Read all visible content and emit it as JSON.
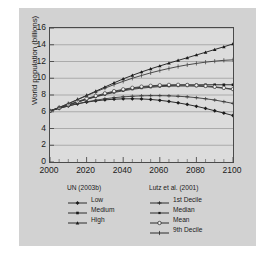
{
  "chart_data": {
    "type": "line",
    "title": "",
    "subtitle": "",
    "xlabel": "",
    "ylabel": "World population (billions)",
    "xlim": [
      2000,
      2100
    ],
    "ylim": [
      0,
      16
    ],
    "xticks": [
      "2000",
      "2020",
      "2040",
      "2060",
      "2080",
      "2100"
    ],
    "yticks": [
      "0",
      "2",
      "4",
      "6",
      "8",
      "10",
      "12",
      "14",
      "16"
    ],
    "xtick_step": 20,
    "ytick_step": 2,
    "minor_xtick_step": 5,
    "grid": "horizontal",
    "legend_position": "below",
    "x": [
      2000,
      2005,
      2010,
      2015,
      2020,
      2025,
      2030,
      2035,
      2040,
      2045,
      2050,
      2055,
      2060,
      2065,
      2070,
      2075,
      2080,
      2085,
      2090,
      2095,
      2100
    ],
    "legend_groups": [
      {
        "title": "UN (2003b)",
        "entries": [
          {
            "label": "Low",
            "marker": "filled-diamond"
          },
          {
            "label": "Medium",
            "marker": "filled-square"
          },
          {
            "label": "High",
            "marker": "filled-triangle"
          }
        ]
      },
      {
        "title": "Lutz et al. (2001)",
        "entries": [
          {
            "label": "1st Decile",
            "marker": "dash-x"
          },
          {
            "label": "Median",
            "marker": "filled-square-small"
          },
          {
            "label": "Mean",
            "marker": "open-circle"
          },
          {
            "label": "9th Decile",
            "marker": "plus"
          }
        ]
      }
    ],
    "series": [
      {
        "name": "Low",
        "group": "UN (2003b)",
        "marker": "filled-diamond",
        "color": "#1a1a1a",
        "values": [
          6.1,
          6.4,
          6.7,
          6.95,
          7.15,
          7.3,
          7.42,
          7.5,
          7.54,
          7.55,
          7.53,
          7.47,
          7.37,
          7.23,
          7.06,
          6.87,
          6.65,
          6.4,
          6.12,
          5.84,
          5.55
        ]
      },
      {
        "name": "Medium",
        "group": "UN (2003b)",
        "marker": "filled-square",
        "color": "#1a1a1a",
        "values": [
          6.1,
          6.45,
          6.8,
          7.15,
          7.5,
          7.82,
          8.11,
          8.37,
          8.6,
          8.78,
          8.92,
          9.02,
          9.1,
          9.15,
          9.18,
          9.2,
          9.21,
          9.22,
          9.22,
          9.22,
          9.22
        ]
      },
      {
        "name": "High",
        "group": "UN (2003b)",
        "marker": "filled-triangle",
        "color": "#1a1a1a",
        "values": [
          6.1,
          6.5,
          6.95,
          7.45,
          7.95,
          8.45,
          8.95,
          9.45,
          9.92,
          10.35,
          10.75,
          11.12,
          11.47,
          11.8,
          12.13,
          12.45,
          12.78,
          13.1,
          13.43,
          13.76,
          14.1
        ]
      },
      {
        "name": "1st Decile",
        "group": "Lutz et al. (2001)",
        "marker": "dash-x",
        "color": "#3a3a3a",
        "values": [
          6.1,
          6.4,
          6.68,
          6.95,
          7.18,
          7.38,
          7.55,
          7.68,
          7.78,
          7.85,
          7.9,
          7.92,
          7.92,
          7.9,
          7.85,
          7.78,
          7.68,
          7.55,
          7.4,
          7.2,
          7.0
        ]
      },
      {
        "name": "Median",
        "group": "Lutz et al. (2001)",
        "marker": "filled-square-small",
        "color": "#3a3a3a",
        "values": [
          6.1,
          6.45,
          6.8,
          7.15,
          7.48,
          7.78,
          8.05,
          8.3,
          8.5,
          8.68,
          8.82,
          8.92,
          9.0,
          9.05,
          9.07,
          9.07,
          9.05,
          9.0,
          8.92,
          8.8,
          8.65
        ]
      },
      {
        "name": "Mean",
        "group": "Lutz et al. (2001)",
        "marker": "open-circle",
        "color": "#3a3a3a",
        "values": [
          6.1,
          6.46,
          6.84,
          7.22,
          7.58,
          7.9,
          8.2,
          8.46,
          8.68,
          8.86,
          9.0,
          9.1,
          9.17,
          9.21,
          9.22,
          9.2,
          9.15,
          9.08,
          8.98,
          8.85,
          8.7
        ]
      },
      {
        "name": "9th Decile",
        "group": "Lutz et al. (2001)",
        "marker": "plus",
        "color": "#3a3a3a",
        "values": [
          6.1,
          6.52,
          6.98,
          7.45,
          7.92,
          8.38,
          8.82,
          9.24,
          9.63,
          10.0,
          10.33,
          10.64,
          10.92,
          11.17,
          11.4,
          11.6,
          11.77,
          11.92,
          12.04,
          12.14,
          12.2
        ]
      }
    ]
  }
}
